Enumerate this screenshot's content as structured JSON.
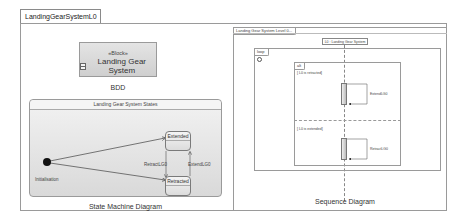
{
  "tab": {
    "label": "LandingGearSystemL0"
  },
  "bdd": {
    "block": {
      "stereotype": "«Block»",
      "name": "Landing Gear System",
      "icon": "block-icon"
    },
    "caption": "BDD"
  },
  "state_machine": {
    "title": "Landing Gear System States",
    "initial_label": "Initialisation",
    "states": [
      {
        "name": "Extended"
      },
      {
        "name": "Retracted"
      }
    ],
    "transitions": [
      {
        "from": "Initialisation",
        "to": "Extended",
        "label": ""
      },
      {
        "from": "Initialisation",
        "to": "Retracted",
        "label": ""
      },
      {
        "from": "Extended",
        "to": "Retracted",
        "label": "RetractLG0"
      },
      {
        "from": "Retracted",
        "to": "Extended",
        "label": "ExtendLG0"
      }
    ],
    "caption": "State Machine Diagram"
  },
  "sequence": {
    "frame_label": "Landing Gear System Level 0...",
    "lifeline": "L0 : Landing Gear System",
    "loop_label": "loop",
    "alt_label": "alt",
    "operands": [
      {
        "guard": "[ L0 is retracted]",
        "message": "ExtendLG0"
      },
      {
        "guard": "[ L0 is extended]",
        "message": "RetractLG0"
      }
    ],
    "caption": "Sequence Diagram"
  },
  "colors": {
    "border": "#9a9a9a",
    "state_fill": "#dcdcdc",
    "initial_node": "#111111"
  }
}
